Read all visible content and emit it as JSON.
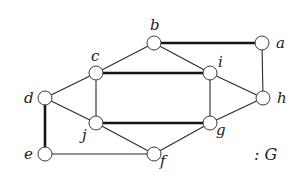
{
  "graph": {
    "name": "G",
    "caption": ": G",
    "nodes": [
      {
        "id": "a",
        "label": "a",
        "x": 262,
        "y": 43,
        "lx": 276,
        "ly": 48
      },
      {
        "id": "b",
        "label": "b",
        "x": 154,
        "y": 43,
        "lx": 150,
        "ly": 30
      },
      {
        "id": "c",
        "label": "c",
        "x": 96,
        "y": 73,
        "lx": 91,
        "ly": 61
      },
      {
        "id": "d",
        "label": "d",
        "x": 45,
        "y": 98,
        "lx": 24,
        "ly": 103
      },
      {
        "id": "e",
        "label": "e",
        "x": 45,
        "y": 154,
        "lx": 24,
        "ly": 159
      },
      {
        "id": "f",
        "label": "f",
        "x": 154,
        "y": 154,
        "lx": 160,
        "ly": 166
      },
      {
        "id": "g",
        "label": "g",
        "x": 210,
        "y": 123,
        "lx": 216,
        "ly": 135
      },
      {
        "id": "h",
        "label": "h",
        "x": 263,
        "y": 98,
        "lx": 277,
        "ly": 103
      },
      {
        "id": "i",
        "label": "i",
        "x": 210,
        "y": 73,
        "lx": 218,
        "ly": 67
      },
      {
        "id": "j",
        "label": "j",
        "x": 96,
        "y": 123,
        "lx": 82,
        "ly": 140
      }
    ],
    "edges": [
      {
        "from": "b",
        "to": "a",
        "thick": true
      },
      {
        "from": "b",
        "to": "c",
        "thick": false
      },
      {
        "from": "b",
        "to": "i",
        "thick": false
      },
      {
        "from": "a",
        "to": "h",
        "thick": false
      },
      {
        "from": "c",
        "to": "i",
        "thick": true
      },
      {
        "from": "c",
        "to": "d",
        "thick": false
      },
      {
        "from": "c",
        "to": "j",
        "thick": false
      },
      {
        "from": "i",
        "to": "h",
        "thick": false
      },
      {
        "from": "i",
        "to": "g",
        "thick": false
      },
      {
        "from": "d",
        "to": "j",
        "thick": false
      },
      {
        "from": "d",
        "to": "e",
        "thick": true
      },
      {
        "from": "j",
        "to": "g",
        "thick": true
      },
      {
        "from": "j",
        "to": "f",
        "thick": false
      },
      {
        "from": "h",
        "to": "g",
        "thick": false
      },
      {
        "from": "g",
        "to": "f",
        "thick": false
      },
      {
        "from": "e",
        "to": "f",
        "thick": false
      }
    ],
    "node_radius": 7,
    "caption_pos": {
      "x": 254,
      "y": 160
    }
  }
}
